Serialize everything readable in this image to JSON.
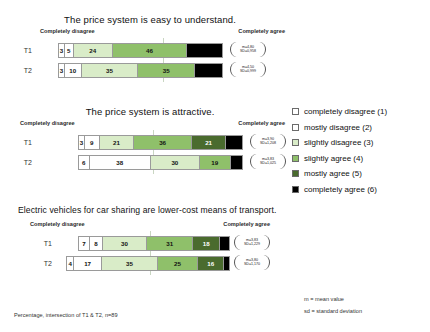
{
  "chart_data": [
    {
      "type": "bar",
      "title": "The price system is easy to understand.",
      "axis_left_label": "Completely disagree",
      "axis_right_label": "Completely agree",
      "xlabel": "",
      "ylabel": "",
      "stacked": true,
      "orientation": "horizontal",
      "units": "percent",
      "categories": [
        "completely disagree (1)",
        "mostly disagree (2)",
        "slightly disagree (3)",
        "slightly agree (4)",
        "mostly agree (5)",
        "completely agree (6)"
      ],
      "rows": [
        {
          "label": "T1",
          "values": [
            3,
            5,
            24,
            46,
            0,
            22
          ],
          "labels": [
            "3",
            "5",
            "24",
            "46",
            "",
            ""
          ],
          "mean": "m=4,80",
          "sd": "SD=0,958"
        },
        {
          "label": "T2",
          "values": [
            3,
            10,
            35,
            35,
            0,
            17
          ],
          "labels": [
            "3",
            "10",
            "35",
            "35",
            "",
            ""
          ],
          "mean": "m=4,50",
          "sd": "SD=0,999"
        }
      ]
    },
    {
      "type": "bar",
      "title": "The price system is attractive.",
      "axis_left_label": "Completely disagree",
      "axis_right_label": "Completely agree",
      "xlabel": "",
      "ylabel": "",
      "stacked": true,
      "orientation": "horizontal",
      "units": "percent",
      "categories": [
        "completely disagree (1)",
        "mostly disagree (2)",
        "slightly disagree (3)",
        "slightly agree (4)",
        "mostly agree (5)",
        "completely agree (6)"
      ],
      "rows": [
        {
          "label": "T1",
          "values": [
            3,
            9,
            21,
            36,
            21,
            10
          ],
          "labels": [
            "3",
            "9",
            "21",
            "36",
            "21",
            ""
          ],
          "mean": "m=3,90",
          "sd": "SD=1,208"
        },
        {
          "label": "T2",
          "values": [
            6,
            38,
            30,
            19,
            0,
            7
          ],
          "labels": [
            "6",
            "38",
            "30",
            "19",
            "",
            ""
          ],
          "mean": "m=3,83",
          "sd": "SD=1,025"
        }
      ]
    },
    {
      "type": "bar",
      "title": "Electric vehicles for car sharing are lower-cost means of transport.",
      "axis_left_label": "Completely disagree",
      "axis_right_label": "Completely agree",
      "xlabel": "",
      "ylabel": "",
      "stacked": true,
      "orientation": "horizontal",
      "units": "percent",
      "categories": [
        "completely disagree (1)",
        "mostly disagree (2)",
        "slightly disagree (3)",
        "slightly agree (4)",
        "mostly agree (5)",
        "completely agree (6)"
      ],
      "rows": [
        {
          "label": "T1",
          "values": [
            7,
            8,
            30,
            31,
            18,
            6
          ],
          "labels": [
            "7",
            "8",
            "30",
            "31",
            "18",
            ""
          ],
          "mean": "m=3,83",
          "sd": "SD=1,229"
        },
        {
          "label": "T2",
          "values": [
            4,
            17,
            35,
            25,
            16,
            3
          ],
          "labels": [
            "4",
            "17",
            "35",
            "25",
            "16",
            ""
          ],
          "mean": "m=3,80",
          "sd": "SD=1,170"
        }
      ]
    }
  ],
  "legend": {
    "items": [
      {
        "label": "completely disagree (1)",
        "color": "#ffffff",
        "text_color": "#111111"
      },
      {
        "label": "mostly disagree (2)",
        "color": "#ffffff",
        "text_color": "#111111"
      },
      {
        "label": "slightly disagree (3)",
        "color": "#d9ecc8",
        "text_color": "#111111"
      },
      {
        "label": "slightly agree (4)",
        "color": "#8fc06a",
        "text_color": "#111111"
      },
      {
        "label": "mostly agree (5)",
        "color": "#4a6b2e",
        "text_color": "#ffffff"
      },
      {
        "label": "completely agree (6)",
        "color": "#000000",
        "text_color": "#ffffff"
      }
    ]
  },
  "notes": {
    "mean_note": "m = mean value",
    "sd_note": "sd = standard deviation",
    "footnote": "Percentage, intersection of T1 & T2, n=89"
  }
}
